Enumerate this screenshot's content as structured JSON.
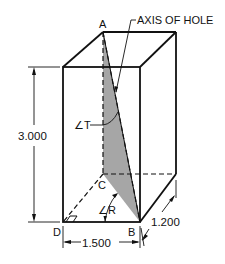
{
  "diagram": {
    "labels": {
      "axis_of_hole": "AXIS OF HOLE",
      "point_a": "A",
      "point_b": "B",
      "point_c": "C",
      "point_d": "D",
      "angle_t": "∠T",
      "angle_r": "∠R"
    },
    "dimensions": {
      "height": "3.000",
      "width": "1.500",
      "depth": "1.200"
    },
    "colors": {
      "line": "#111111",
      "shade": "#a6a6a6",
      "background": "#ffffff"
    }
  }
}
